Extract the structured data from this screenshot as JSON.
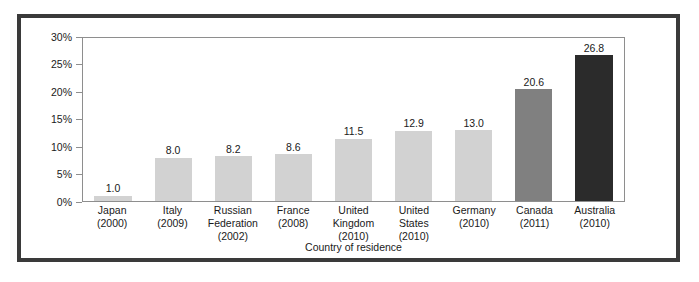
{
  "chart_data": {
    "type": "bar",
    "title": "",
    "xlabel": "Country of residence",
    "ylabel": "",
    "ylim": [
      0,
      30
    ],
    "grid": false,
    "legend": "none",
    "y_tick_labels": [
      "30%",
      "25%",
      "20%",
      "15%",
      "10%",
      "5%",
      "0%"
    ],
    "y_tick_values": [
      30,
      25,
      20,
      15,
      10,
      5,
      0
    ],
    "categories": [
      "Japan",
      "Italy",
      "Russian Federation",
      "France",
      "United Kingdom",
      "United States",
      "Germany",
      "Canada",
      "Australia"
    ],
    "category_years": [
      "(2000)",
      "(2009)",
      "(2002)",
      "(2008)",
      "(2010)",
      "(2010)",
      "(2010)",
      "(2011)",
      "(2010)"
    ],
    "values": [
      1.0,
      8.0,
      8.2,
      8.6,
      11.5,
      12.9,
      13.0,
      20.6,
      26.8
    ],
    "value_labels": [
      "1.0",
      "8.0",
      "8.2",
      "8.6",
      "11.5",
      "12.9",
      "13.0",
      "20.6",
      "26.8"
    ],
    "bar_colors": [
      "#d2d2d2",
      "#d2d2d2",
      "#d2d2d2",
      "#d2d2d2",
      "#d2d2d2",
      "#d2d2d2",
      "#d2d2d2",
      "#808080",
      "#2b2b2b"
    ]
  },
  "colors": {
    "bar_light": "#d2d2d2",
    "bar_mid": "#808080",
    "bar_dark": "#2b2b2b",
    "frame_border": "#3a3a3a",
    "axis_line": "#8e8e8e",
    "text": "#1a1a1a"
  }
}
